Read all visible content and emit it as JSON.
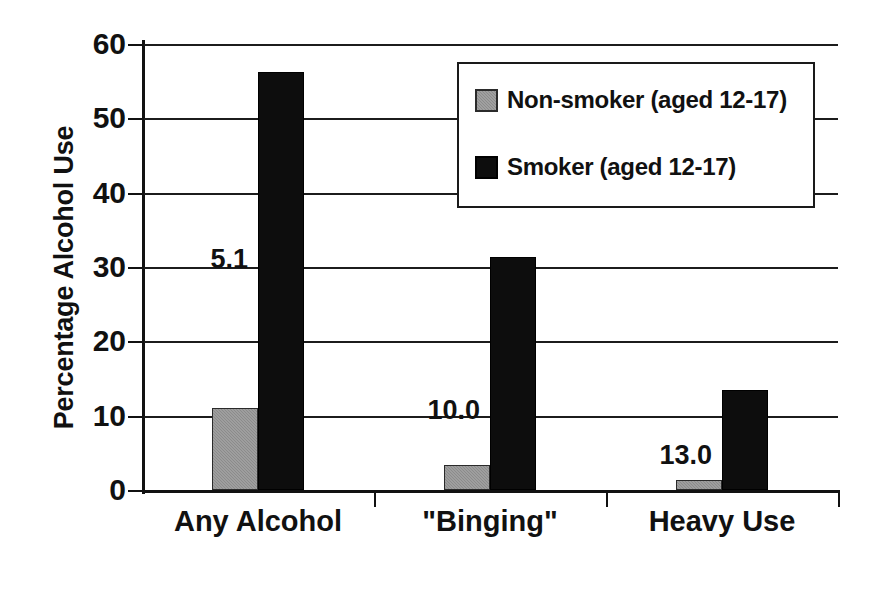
{
  "chart_data": {
    "type": "bar",
    "title": "",
    "subtitle": "",
    "xlabel": "",
    "ylabel": "Percentage Alcohol Use",
    "ylim": [
      0,
      60
    ],
    "yticks": [
      0,
      10,
      20,
      30,
      40,
      50,
      60
    ],
    "ytick_labels": [
      "0",
      "10",
      "20",
      "30",
      "40",
      "50",
      "60"
    ],
    "grid": true,
    "grid_axis": "y",
    "legend_position": "top-right-inside",
    "categories": [
      "Any Alcohol",
      "\"Binging\"",
      "Heavy Use"
    ],
    "series": [
      {
        "name": "Non-smoker (aged 12-17)",
        "color": "#8b8b8b",
        "values": [
          11.1,
          3.3,
          1.3
        ]
      },
      {
        "name": "Smoker (aged 12-17)",
        "color": "#0d0d0d",
        "values": [
          56.2,
          31.3,
          13.5
        ]
      }
    ],
    "annotations": [
      {
        "text": "5.1",
        "category": "Any Alcohol"
      },
      {
        "text": "10.0",
        "category": "\"Binging\""
      },
      {
        "text": "13.0",
        "category": "Heavy Use"
      }
    ]
  },
  "axis": {
    "y_title": "Percentage Alcohol Use",
    "tick_labels": [
      "60",
      "50",
      "40",
      "30",
      "20",
      "10",
      "0"
    ]
  },
  "categories": [
    {
      "label": "Any Alcohol"
    },
    {
      "label": "\"Binging\""
    },
    {
      "label": "Heavy Use"
    }
  ],
  "legend": {
    "entries": [
      {
        "label": "Non-smoker (aged 12-17)",
        "swatch": "gray"
      },
      {
        "label": "Smoker (aged 12-17)",
        "swatch": "black"
      }
    ]
  },
  "annotations": [
    {
      "value": "5.1"
    },
    {
      "value": "10.0"
    },
    {
      "value": "13.0"
    }
  ]
}
